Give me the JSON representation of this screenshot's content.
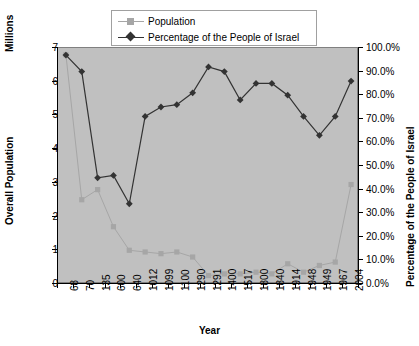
{
  "chart_data": {
    "type": "line",
    "title": "",
    "xlabel": "Year",
    "ylabel": "Overall Population",
    "ylabel_units": "Millions",
    "y2label": "Percentage of the People of Israel",
    "ylim": [
      0,
      7
    ],
    "y2lim": [
      0,
      100
    ],
    "grid": false,
    "legend_position": "top-center",
    "categories": [
      "68",
      "70",
      "135",
      "600",
      "640",
      "1012",
      "1099",
      "1100",
      "1290",
      "1291",
      "1400",
      "1517",
      "1800",
      "1840",
      "1914",
      "1948",
      "1949",
      "1967",
      "2004"
    ],
    "series": [
      {
        "name": "Population",
        "axis": "left",
        "units": "millions",
        "color": "#a6a6a6",
        "marker": "square",
        "values": [
          6.8,
          2.5,
          2.8,
          1.7,
          1.0,
          0.95,
          0.9,
          0.95,
          0.8,
          0.25,
          0.3,
          0.3,
          0.35,
          0.3,
          0.6,
          0.35,
          0.55,
          0.65,
          2.95
        ]
      },
      {
        "name": "Percentage of the People of Israel",
        "axis": "right",
        "units": "percent",
        "color": "#333333",
        "marker": "diamond",
        "values": [
          97.0,
          90.0,
          45.0,
          46.0,
          34.0,
          71.0,
          75.0,
          76.0,
          81.0,
          92.0,
          90.0,
          78.0,
          85.0,
          85.0,
          80.0,
          71.0,
          63.0,
          71.0,
          86.0
        ]
      }
    ],
    "yticks_left": [
      "0",
      "1",
      "2",
      "3",
      "4",
      "5",
      "6",
      "7"
    ],
    "yticks_right": [
      "0.0%",
      "10.0%",
      "20.0%",
      "30.0%",
      "40.0%",
      "50.0%",
      "60.0%",
      "70.0%",
      "80.0%",
      "90.0%",
      "100.0%"
    ],
    "plot_background": "#c0c0c0"
  },
  "legend": {
    "items": [
      {
        "label": "Population"
      },
      {
        "label": "Percentage of the People of Israel"
      }
    ]
  }
}
